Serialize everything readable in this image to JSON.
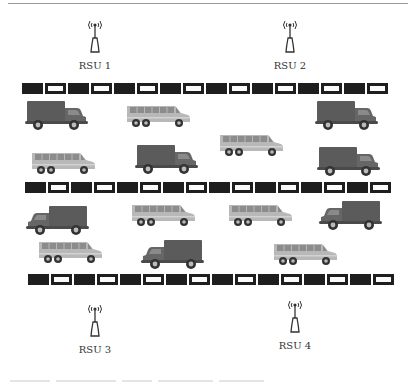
{
  "diagram": {
    "colors": {
      "road_dark": "#1e1e1e",
      "road_light": "#fafafa",
      "truck_body": "#5b5b5b",
      "truck_cab": "#666666",
      "bus_body": "#b8b8b8",
      "bus_windows": "#8c8c8c",
      "wheel": "#333333",
      "text": "#333333"
    },
    "rsus": [
      {
        "id": "rsu1",
        "label": "RSU 1",
        "x": 95,
        "y": 18
      },
      {
        "id": "rsu2",
        "label": "RSU 2",
        "x": 290,
        "y": 18
      },
      {
        "id": "rsu3",
        "label": "RSU 3",
        "x": 95,
        "y": 302
      },
      {
        "id": "rsu4",
        "label": "RSU 4",
        "x": 295,
        "y": 298
      }
    ],
    "roads": [
      {
        "id": "road-top",
        "x": 22,
        "y": 83,
        "cells": 16
      },
      {
        "id": "road-middle",
        "x": 25,
        "y": 182,
        "cells": 16
      },
      {
        "id": "road-bottom",
        "x": 28,
        "y": 274,
        "cells": 16
      }
    ],
    "vehicles": [
      {
        "type": "truck",
        "dir": "right",
        "x": 25,
        "y": 99
      },
      {
        "type": "bus",
        "x": 125,
        "y": 104
      },
      {
        "type": "truck",
        "dir": "right",
        "x": 315,
        "y": 99
      },
      {
        "type": "bus",
        "x": 218,
        "y": 133
      },
      {
        "type": "bus",
        "x": 30,
        "y": 151
      },
      {
        "type": "truck",
        "dir": "right",
        "x": 135,
        "y": 143
      },
      {
        "type": "truck",
        "dir": "right",
        "x": 317,
        "y": 145
      },
      {
        "type": "truck",
        "dir": "left",
        "x": 25,
        "y": 204
      },
      {
        "type": "bus",
        "x": 130,
        "y": 203
      },
      {
        "type": "bus",
        "x": 227,
        "y": 203
      },
      {
        "type": "truck",
        "dir": "left",
        "x": 318,
        "y": 199
      },
      {
        "type": "bus",
        "x": 37,
        "y": 240
      },
      {
        "type": "truck",
        "dir": "left",
        "x": 140,
        "y": 238
      },
      {
        "type": "bus",
        "x": 272,
        "y": 242
      }
    ]
  }
}
